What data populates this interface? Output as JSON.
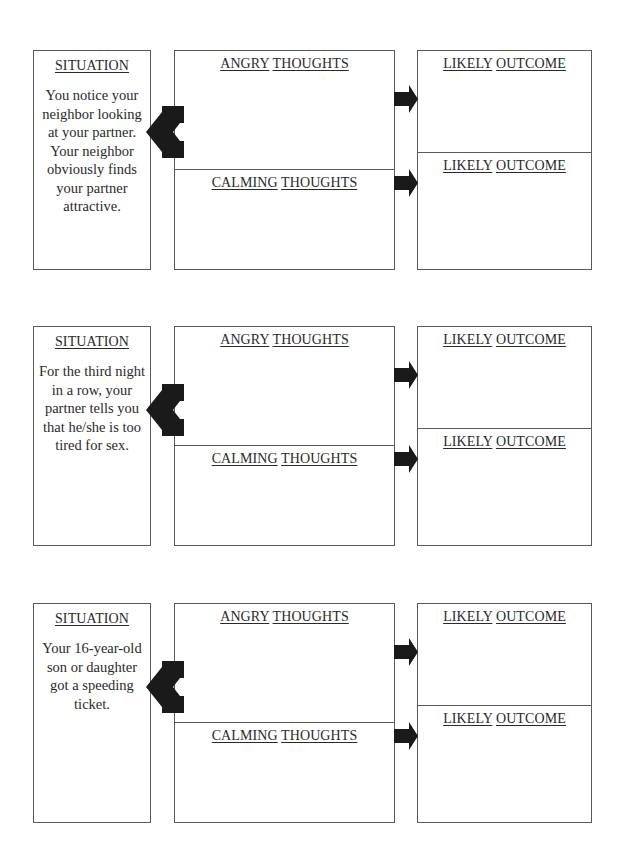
{
  "worksheet": {
    "labels": {
      "situation": "SITUATION",
      "angry_word1": "ANGRY",
      "angry_word2": "THOUGHTS",
      "calming_word1": "CALMING",
      "calming_word2": "THOUGHTS",
      "outcome_word1": "LIKELY",
      "outcome_word2": "OUTCOME"
    },
    "scenarios": [
      {
        "situation_text": "You notice your neighbor looking at your partner. Your neighbor obviously finds your partner attractive."
      },
      {
        "situation_text": "For the third night in a row, your partner tells you that he/she is too tired for sex."
      },
      {
        "situation_text": "Your 16-year-old son or daughter got a speeding ticket."
      }
    ],
    "icons": {
      "left_arrow": "notched-left-arrow-icon",
      "right_arrow": "right-arrow-icon"
    },
    "colors": {
      "border": "#5a5a5a",
      "arrow": "#1a1a1a",
      "text": "#2a2a2a"
    }
  }
}
